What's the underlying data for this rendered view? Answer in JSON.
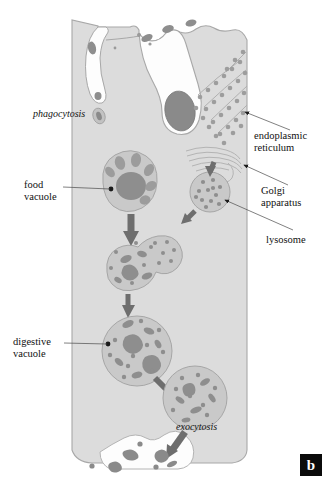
{
  "figure": {
    "panel_letter": "b",
    "title_implied": "Phagocytosis and intracellular digestion",
    "background_color": "#ffffff",
    "cytoplasm_color": "#dcdcdc",
    "membrane_color": "#9a9a9a",
    "organelle_fill": "#c6c6c6",
    "organelle_dark": "#8e8e8e",
    "debris_color": "#8a8a8a",
    "arrow_color": "#6e6e6e",
    "leader_color": "#4a4a4a"
  },
  "labels": {
    "phagocytosis": "phagocytosis",
    "food_vacuole": "food\nvacuole",
    "digestive_vacuole": "digestive\nvacuole",
    "exocytosis": "exocytosis",
    "endoplasmic_reticulum": "endoplasmic\nreticulum",
    "golgi_apparatus": "Golgi\napparatus",
    "lysosome": "lysosome"
  },
  "diagram_elements": {
    "cell_region": "vertical cell body occupying center of frame",
    "membrane_invagination": "phagocytic cup engulfing particle at top membrane",
    "rough_er": "diagonal stacked membranes studded with ribosome dots, upper right",
    "golgi": "stack of flattened curved cisternae, middle right",
    "lysosomes": "small speckled vesicles budding from Golgi",
    "vacuole_stages": [
      "food vacuole with large dark ingested mass",
      "vacuole fusing with lysosome",
      "vacuole with partly digested fragments",
      "digestive vacuole with dispersed fragments",
      "residual vacuole with small debris",
      "exocytosis releasing debris through membrane"
    ],
    "exocytosis_site": "membrane bay at bottom expelling undigested debris"
  }
}
